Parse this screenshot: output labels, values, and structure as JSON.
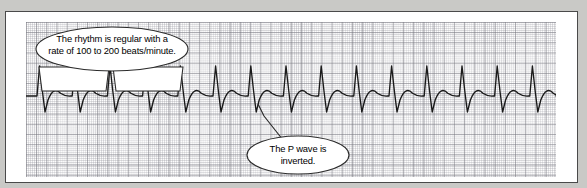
{
  "figure": {
    "type": "ecg-rhythm-strip",
    "paper": {
      "small_box_px": 2.04,
      "large_box_px": 10.2,
      "fine_grid_color": "#969ca0",
      "bold_grid_color": "#787880",
      "paper_color": "#fdfdfd",
      "frame_color": "#4a4a4a",
      "page_background": "#c9c9c6"
    },
    "trace": {
      "color": "#1a1a1a",
      "baseline_y": 74,
      "beat_spacing_px": 35.2,
      "first_beat_x": 15,
      "beat_count": 15,
      "r_peak_height_px": 30,
      "p_wave_depth_px": 16,
      "t_bump_height_px": 5,
      "morphology": "narrow tall R spike, deep inverted P wave following QRS, small rounded positive bump before baseline"
    }
  },
  "callouts": [
    {
      "id": "rhythm",
      "text": "The rhythm is regular with a rate of 100 to 200 beats/minute.",
      "line1": "The rhythm is regular with a",
      "line2": "rate of 100 to 200 beats/minute.",
      "tail_style": "double-bracket",
      "points_to": "two consecutive R-R intervals"
    },
    {
      "id": "pwave",
      "text": "The P wave is inverted.",
      "line1": "The P wave is",
      "line2": "inverted.",
      "tail_style": "pointer-line",
      "points_to": "inverted P wave"
    }
  ],
  "chart_data": {
    "type": "line",
    "title": "",
    "xlabel": "",
    "ylabel": "",
    "grid": true,
    "legend_position": "none",
    "annotations": [
      "The rhythm is regular with a rate of 100 to 200 beats/minute.",
      "The P wave is inverted."
    ],
    "series": [
      {
        "name": "ECG lead tracing",
        "description": "Supraventricular tachycardia rhythm strip with inverted P waves",
        "beats": 15,
        "beat_spacing_px": 35.2,
        "baseline_mv": 0,
        "r_peak_mv": 1.5,
        "p_wave_mv": -0.8,
        "t_wave_mv": 0.25
      }
    ]
  }
}
